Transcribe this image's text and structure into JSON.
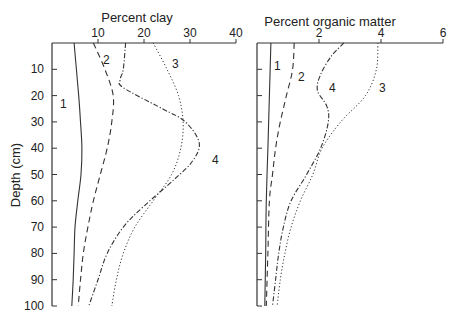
{
  "chart_data": [
    {
      "type": "line",
      "title": "Percent clay",
      "xlabel": "Percent clay",
      "ylabel": "Depth (cm)",
      "xlim": [
        0,
        40
      ],
      "ylim": [
        100,
        0
      ],
      "x_ticks": [
        10,
        20,
        30,
        40
      ],
      "y_ticks": [
        10,
        20,
        30,
        40,
        50,
        60,
        70,
        80,
        90,
        100
      ],
      "grid": false,
      "series": [
        {
          "name": "1",
          "style": "solid",
          "depth": [
            0,
            10,
            20,
            30,
            40,
            50,
            60,
            70,
            80,
            90,
            100
          ],
          "values": [
            4.8,
            5.3,
            5.8,
            6.2,
            6.5,
            6.3,
            5.6,
            5.0,
            4.8,
            4.6,
            4.3
          ]
        },
        {
          "name": "2",
          "style": "dashed",
          "depth": [
            0,
            10,
            20,
            30,
            40,
            50,
            60,
            70,
            80,
            90,
            100
          ],
          "values": [
            9.0,
            11.5,
            13.3,
            13.0,
            12.0,
            10.5,
            9.0,
            7.8,
            6.8,
            6.2,
            5.7
          ]
        },
        {
          "name": "3",
          "style": "dotted",
          "depth": [
            0,
            10,
            20,
            30,
            40,
            50,
            60,
            70,
            80,
            90,
            100
          ],
          "values": [
            22.0,
            25.0,
            27.5,
            28.5,
            28.0,
            26.0,
            22.0,
            18.0,
            15.5,
            14.0,
            13.0
          ]
        },
        {
          "name": "4",
          "style": "dash-dot",
          "depth": [
            0,
            10,
            14,
            17,
            25,
            30,
            38,
            45,
            52,
            62,
            70,
            80,
            90,
            100
          ],
          "values": [
            16.0,
            15.5,
            14.8,
            15.5,
            24.0,
            29.0,
            32.0,
            30.5,
            26.5,
            20.0,
            15.5,
            12.0,
            10.0,
            8.0
          ]
        }
      ]
    },
    {
      "type": "line",
      "title": "Percent organic matter",
      "xlabel": "Percent organic matter",
      "ylabel": "Depth (cm)",
      "xlim": [
        0,
        6
      ],
      "ylim": [
        100,
        0
      ],
      "x_ticks": [
        2,
        4,
        6
      ],
      "y_ticks": [
        10,
        20,
        30,
        40,
        50,
        60,
        70,
        80,
        90,
        100
      ],
      "grid": false,
      "series": [
        {
          "name": "1",
          "style": "solid",
          "depth": [
            0,
            20,
            40,
            60,
            80,
            100
          ],
          "values": [
            0.45,
            0.4,
            0.35,
            0.3,
            0.28,
            0.25
          ]
        },
        {
          "name": "2",
          "style": "dashed",
          "depth": [
            0,
            10,
            20,
            30,
            40,
            50,
            60,
            80,
            100
          ],
          "values": [
            1.2,
            1.15,
            0.95,
            0.75,
            0.6,
            0.5,
            0.4,
            0.35,
            0.3
          ]
        },
        {
          "name": "3",
          "style": "dotted",
          "depth": [
            0,
            10,
            20,
            30,
            40,
            50,
            60,
            70,
            80,
            90,
            100
          ],
          "values": [
            3.9,
            3.85,
            3.5,
            2.7,
            2.1,
            1.8,
            1.4,
            1.1,
            0.9,
            0.75,
            0.65
          ]
        },
        {
          "name": "4",
          "style": "dash-dot",
          "depth": [
            0,
            5,
            12,
            18,
            24,
            30,
            40,
            50,
            60,
            70,
            80,
            90,
            100
          ],
          "values": [
            2.8,
            2.4,
            2.05,
            1.95,
            2.25,
            2.3,
            2.05,
            1.6,
            1.1,
            0.85,
            0.7,
            0.6,
            0.5
          ]
        }
      ]
    }
  ],
  "panels": {
    "clay": {
      "title": "Percent clay",
      "x_tick_labels": [
        "10",
        "20",
        "30",
        "40"
      ]
    },
    "om": {
      "title": "Percent organic matter",
      "x_tick_labels": [
        "2",
        "4",
        "6"
      ]
    },
    "y_axis_label": "Depth (cm)",
    "y_tick_labels": [
      "10",
      "20",
      "30",
      "40",
      "50",
      "60",
      "70",
      "80",
      "90",
      "100"
    ]
  }
}
